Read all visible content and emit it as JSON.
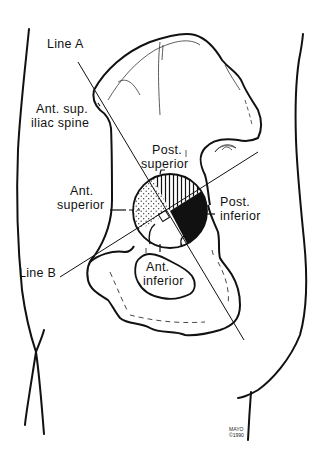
{
  "diagram": {
    "labels": {
      "line_a": "Line A",
      "line_b": "Line B",
      "asis_line1": "Ant. sup.",
      "asis_line2": "iliac spine",
      "post_sup_line1": "Post.",
      "post_sup_line2": "superior",
      "ant_sup_line1": "Ant.",
      "ant_sup_line2": "superior",
      "post_inf_line1": "Post.",
      "post_inf_line2": "inferior",
      "ant_inf_line1": "Ant.",
      "ant_inf_line2": "inferior"
    },
    "credit": {
      "line1": "MAYO",
      "line2": "©1990"
    },
    "quadrants": [
      {
        "name": "Post. superior",
        "fill": "vertical-hatch"
      },
      {
        "name": "Ant. superior",
        "fill": "stipple"
      },
      {
        "name": "Post. inferior",
        "fill": "solid-black"
      },
      {
        "name": "Ant. inferior",
        "fill": "none"
      }
    ],
    "colors": {
      "ink": "#111111",
      "background": "#ffffff"
    },
    "acetabulum_circle": {
      "cx": 170,
      "cy": 211,
      "r": 37
    }
  }
}
